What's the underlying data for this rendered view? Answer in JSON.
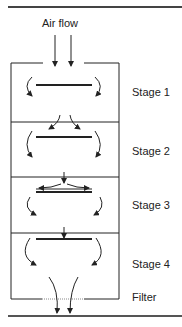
{
  "diagram": {
    "title": "Air flow",
    "stages": [
      {
        "label": "Stage 1"
      },
      {
        "label": "Stage 2"
      },
      {
        "label": "Stage 3"
      },
      {
        "label": "Stage 4"
      }
    ],
    "filter_label": "Filter",
    "colors": {
      "line": "#222222",
      "filter_dots": "#777777"
    }
  }
}
